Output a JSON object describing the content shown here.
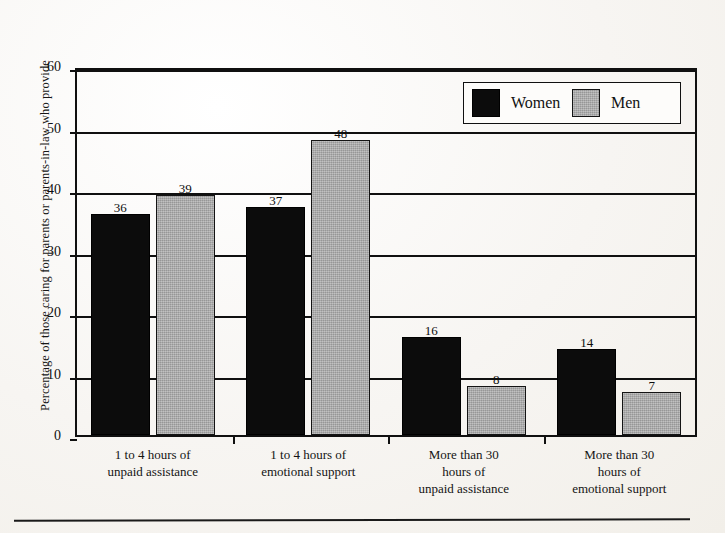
{
  "chart_data": {
    "type": "bar",
    "title": "",
    "subtitle": "",
    "xlabel": "",
    "ylabel": "Percentage of those caring for parents or parents-in-law who provide",
    "ylim": [
      0,
      60
    ],
    "yticks": [
      0,
      10,
      20,
      30,
      40,
      50,
      60
    ],
    "grid": true,
    "legend_position": "top-right",
    "categories": [
      "1 to 4 hours of\nunpaid assistance",
      "1 to 4 hours of\nemotional support",
      "More than 30\nhours of\nunpaid assistance",
      "More than 30\nhours of\nemotional support"
    ],
    "category_lines": [
      [
        "1 to 4 hours of",
        "unpaid assistance"
      ],
      [
        "1 to 4 hours of",
        "emotional support"
      ],
      [
        "More than 30",
        "hours of",
        "unpaid assistance"
      ],
      [
        "More than 30",
        "hours of",
        "emotional support"
      ]
    ],
    "series": [
      {
        "name": "Women",
        "color": "#0c0c0c",
        "values": [
          36,
          37,
          16,
          14
        ]
      },
      {
        "name": "Men",
        "color": "#a9a9a9",
        "values": [
          39,
          48,
          8,
          7
        ]
      }
    ],
    "data_labels": {
      "group0": {
        "women": "36",
        "men": "39"
      },
      "group1": {
        "women": "37",
        "men": "48"
      },
      "group2": {
        "women": "16",
        "men": "8"
      },
      "group3": {
        "women": "14",
        "men": "7"
      }
    }
  },
  "legend": {
    "items": [
      {
        "label": "Women",
        "swatch": "black-square-swatch"
      },
      {
        "label": "Men",
        "swatch": "gray-square-swatch"
      }
    ]
  },
  "axis": {
    "y_tick_labels": [
      "60",
      "50",
      "40",
      "30",
      "20",
      "10",
      "0"
    ]
  }
}
